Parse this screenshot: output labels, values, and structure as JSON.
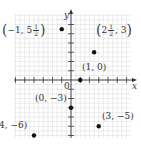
{
  "chart_data": {
    "type": "scatter",
    "title": "",
    "xlabel": "x",
    "ylabel": "y",
    "origin_label": "0",
    "xlim": [
      -6,
      6
    ],
    "ylim": [
      -6,
      6
    ],
    "grid": true,
    "points": [
      {
        "x": -1,
        "y": 5.5,
        "label": "(−1, 5½)"
      },
      {
        "x": 2.5,
        "y": 3,
        "label": "(2½, 3)"
      },
      {
        "x": 1,
        "y": 0,
        "label": "(1, 0)"
      },
      {
        "x": 0,
        "y": -3,
        "label": "(0, −3)"
      },
      {
        "x": 3,
        "y": -5,
        "label": "(3, −5)"
      },
      {
        "x": -4,
        "y": -6,
        "label": "(−4, −6)"
      }
    ]
  },
  "labels": {
    "p1_prefix": "−1, 5",
    "p1_num": "1",
    "p1_den": "2",
    "p2_prefix": "2",
    "p2_num": "1",
    "p2_den": "2",
    "p2_suffix": ", 3",
    "p3": "(1, 0)",
    "p4": "(0, −3)",
    "p5": "(3, −5)",
    "p6": "(−4, −6)",
    "x_axis": "x",
    "y_axis": "y",
    "origin": "0"
  },
  "colors": {
    "grid": "#d8d8d8",
    "axis": "#333333",
    "point": "#111111",
    "text": "#333333"
  }
}
